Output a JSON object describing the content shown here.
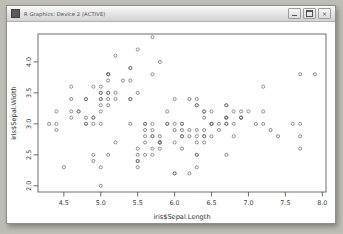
{
  "window": {
    "title": "R Graphics: Device 2 (ACTIVE)",
    "icon": "r-graphics-icon",
    "buttons": [
      {
        "name": "minimize-button",
        "glyph": "minimize-icon"
      },
      {
        "name": "maximize-button",
        "glyph": "maximize-icon"
      },
      {
        "name": "close-button",
        "glyph": "close-icon",
        "label": "×"
      }
    ]
  },
  "chart_data": {
    "type": "scatter",
    "title": "",
    "xlabel": "iris$Sepal.Length",
    "ylabel": "iris$Sepal.Width",
    "xlim": [
      4.15,
      8.05
    ],
    "ylim": [
      1.9,
      4.45
    ],
    "xticks": [
      4.5,
      5.0,
      5.5,
      6.0,
      6.5,
      7.0,
      7.5,
      8.0
    ],
    "yticks": [
      2.0,
      2.5,
      3.0,
      3.5,
      4.0
    ],
    "grid": false,
    "legend": null,
    "marker": {
      "shape": "open-circle",
      "color": "#6d6d6d",
      "size": 3.1,
      "stroke": 0.75
    },
    "series": [
      {
        "name": "iris",
        "x": [
          5.1,
          4.9,
          4.7,
          4.6,
          5.0,
          5.4,
          4.6,
          5.0,
          4.4,
          4.9,
          5.4,
          4.8,
          4.8,
          4.3,
          5.8,
          5.7,
          5.4,
          5.1,
          5.7,
          5.1,
          5.4,
          5.1,
          4.6,
          5.1,
          4.8,
          5.0,
          5.0,
          5.2,
          5.2,
          4.7,
          4.8,
          5.4,
          5.2,
          5.5,
          4.9,
          5.0,
          5.5,
          4.9,
          4.4,
          5.1,
          5.0,
          4.5,
          4.4,
          5.0,
          5.1,
          4.8,
          5.1,
          4.6,
          5.3,
          5.0,
          7.0,
          6.4,
          6.9,
          5.5,
          6.5,
          5.7,
          6.3,
          4.9,
          6.6,
          5.2,
          5.0,
          5.9,
          6.0,
          6.1,
          5.6,
          6.7,
          5.6,
          5.8,
          6.2,
          5.6,
          5.9,
          6.1,
          6.3,
          6.1,
          6.4,
          6.6,
          6.8,
          6.7,
          6.0,
          5.7,
          5.5,
          5.5,
          5.8,
          6.0,
          5.4,
          6.0,
          6.7,
          6.3,
          5.6,
          5.5,
          5.5,
          6.1,
          5.8,
          5.0,
          5.6,
          5.7,
          5.7,
          6.2,
          5.1,
          5.7,
          6.3,
          5.8,
          7.1,
          6.3,
          6.5,
          7.6,
          4.9,
          7.3,
          6.7,
          7.2,
          6.5,
          6.4,
          6.8,
          5.7,
          5.8,
          6.4,
          6.5,
          7.7,
          7.7,
          6.0,
          6.9,
          5.6,
          7.7,
          6.3,
          6.7,
          7.2,
          6.2,
          6.1,
          6.4,
          7.2,
          7.4,
          7.9,
          6.4,
          6.3,
          6.1,
          7.7,
          6.3,
          6.4,
          6.0,
          6.9,
          6.7,
          6.9,
          5.8,
          6.8,
          6.7,
          6.7,
          6.3,
          6.5,
          6.2,
          5.9
        ],
        "y": [
          3.5,
          3.0,
          3.2,
          3.1,
          3.6,
          3.9,
          3.4,
          3.4,
          2.9,
          3.1,
          3.7,
          3.4,
          3.0,
          3.0,
          4.0,
          4.4,
          3.9,
          3.5,
          3.8,
          3.8,
          3.4,
          3.7,
          3.6,
          3.3,
          3.4,
          3.0,
          3.4,
          3.5,
          3.4,
          3.2,
          3.1,
          3.4,
          4.1,
          4.2,
          3.1,
          3.2,
          3.5,
          3.6,
          3.0,
          3.4,
          3.5,
          2.3,
          3.2,
          3.5,
          3.8,
          3.0,
          3.8,
          3.2,
          3.7,
          3.3,
          3.2,
          3.2,
          3.1,
          2.3,
          2.8,
          2.8,
          3.3,
          2.4,
          2.9,
          2.7,
          2.0,
          3.0,
          2.2,
          2.9,
          2.9,
          3.1,
          3.0,
          2.7,
          2.2,
          2.5,
          3.2,
          2.8,
          2.5,
          2.8,
          2.9,
          3.0,
          2.8,
          3.0,
          2.9,
          2.6,
          2.4,
          2.4,
          2.7,
          2.7,
          3.0,
          3.4,
          3.1,
          2.3,
          3.0,
          2.5,
          2.6,
          3.0,
          2.6,
          2.3,
          2.7,
          3.0,
          2.9,
          2.9,
          2.5,
          2.8,
          3.3,
          2.7,
          3.0,
          2.9,
          3.0,
          3.0,
          2.5,
          2.9,
          2.5,
          3.6,
          3.2,
          2.7,
          3.0,
          2.5,
          2.8,
          3.2,
          3.0,
          3.8,
          2.6,
          2.2,
          3.2,
          2.8,
          2.8,
          2.7,
          3.3,
          3.2,
          2.8,
          3.0,
          2.8,
          3.0,
          2.8,
          3.8,
          2.8,
          2.8,
          2.6,
          3.0,
          3.4,
          3.1,
          3.0,
          3.1,
          3.1,
          3.1,
          2.7,
          3.2,
          3.3,
          3.0,
          2.5,
          3.0,
          3.4,
          3.0
        ]
      }
    ]
  }
}
